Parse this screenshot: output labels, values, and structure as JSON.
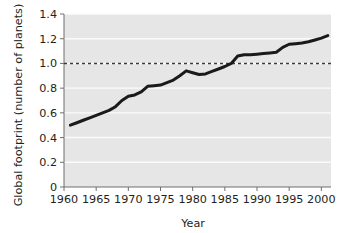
{
  "chart_data": {
    "type": "line",
    "title": "",
    "xlabel": "Year",
    "ylabel": "Global footprint (number of planets)",
    "xlim": [
      1960,
      2001.5
    ],
    "ylim": [
      0,
      1.4
    ],
    "grid": true,
    "legend": null,
    "xticks": [
      1960,
      1965,
      1970,
      1975,
      1980,
      1985,
      1990,
      1995,
      2000
    ],
    "xtick_labels": [
      "1960",
      "1965",
      "1970",
      "1975",
      "1980",
      "1985",
      "1990",
      "1995",
      "2000"
    ],
    "yticks": [
      0,
      0.2,
      0.4,
      0.6,
      0.8,
      1.0,
      1.2,
      1.4
    ],
    "ytick_labels": [
      "0",
      "0.2",
      "0.4",
      "0.6",
      "0.8",
      "1.0",
      "1.2",
      "1.4"
    ],
    "annotations": [
      {
        "name": "one-planet-reference-line",
        "type": "hline",
        "y": 1.0,
        "style": "dashed",
        "color": "#3a3a3a"
      }
    ],
    "series": [
      {
        "name": "Global footprint",
        "color": "#1a1a1a",
        "line_width": 3,
        "x": [
          1961,
          1962,
          1963,
          1964,
          1965,
          1966,
          1967,
          1968,
          1969,
          1970,
          1971,
          1972,
          1973,
          1974,
          1975,
          1976,
          1977,
          1978,
          1979,
          1980,
          1981,
          1982,
          1983,
          1984,
          1985,
          1986,
          1987,
          1988,
          1989,
          1990,
          1991,
          1992,
          1993,
          1994,
          1995,
          1996,
          1997,
          1998,
          1999,
          2000,
          2001
        ],
        "y": [
          0.5,
          0.52,
          0.54,
          0.56,
          0.58,
          0.6,
          0.62,
          0.65,
          0.7,
          0.735,
          0.745,
          0.77,
          0.815,
          0.82,
          0.825,
          0.845,
          0.865,
          0.9,
          0.94,
          0.925,
          0.91,
          0.915,
          0.935,
          0.955,
          0.975,
          1.0,
          1.06,
          1.07,
          1.07,
          1.075,
          1.08,
          1.085,
          1.09,
          1.13,
          1.155,
          1.16,
          1.165,
          1.175,
          1.19,
          1.205,
          1.225
        ]
      }
    ],
    "colors": {
      "plot_background": "#e6e6e6",
      "figure_background": "#ffffff",
      "gridline": "#fbfbfb",
      "axis": "#6e6e6e",
      "line": "#1a1a1a",
      "reference_line": "#3a3a3a"
    }
  }
}
